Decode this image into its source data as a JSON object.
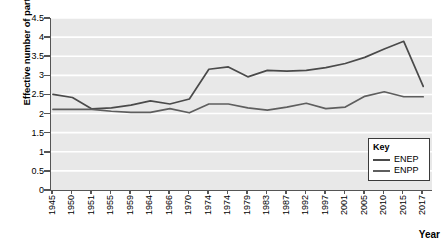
{
  "chart_data": {
    "type": "line",
    "title": "",
    "xlabel": "Year",
    "ylabel": "Effective number of parties",
    "ylim": [
      0,
      4.5
    ],
    "ytick_labels": [
      "4.5",
      "4",
      "3.5",
      "3",
      "2.5",
      "2",
      "1.5",
      "1",
      "0.5",
      "0"
    ],
    "ytick_values": [
      4.5,
      4,
      3.5,
      3,
      2.5,
      2,
      1.5,
      1,
      0.5,
      0
    ],
    "grid": "horizontal",
    "legend_position": "bottom-right",
    "legend_title": "Key",
    "categories": [
      "1945",
      "1950",
      "1951",
      "1955",
      "1959",
      "1964",
      "1966",
      "1970",
      "1974",
      "1974",
      "1979",
      "1983",
      "1987",
      "1992",
      "1997",
      "2001",
      "2005",
      "2010",
      "2015",
      "2017"
    ],
    "series": [
      {
        "name": "ENEP",
        "color": "#4a4a4a",
        "values": [
          2.5,
          2.42,
          2.12,
          2.15,
          2.22,
          2.33,
          2.25,
          2.38,
          3.16,
          3.22,
          2.96,
          3.13,
          3.11,
          3.13,
          3.2,
          3.31,
          3.47,
          3.69,
          3.89,
          2.71
        ]
      },
      {
        "name": "ENPP",
        "color": "#5e5e5e",
        "values": [
          2.11,
          2.11,
          2.11,
          2.06,
          2.03,
          2.03,
          2.13,
          2.02,
          2.25,
          2.25,
          2.15,
          2.09,
          2.17,
          2.27,
          2.13,
          2.17,
          2.45,
          2.57,
          2.44,
          2.44
        ]
      }
    ]
  }
}
